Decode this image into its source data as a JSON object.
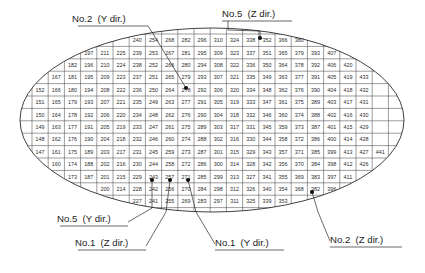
{
  "figure": {
    "type": "elliptical-grid-mesh-diagram",
    "ellipse": {
      "cx": 212,
      "cy": 120,
      "rx": 192,
      "ry": 92
    },
    "grid": {
      "columns": 22,
      "rows": 14,
      "column_step": 14,
      "row_step": -1,
      "cell_width": 16.2,
      "cell_height": 12.4,
      "origin_x": 32,
      "origin_y": 34,
      "first_full_column_base": 147,
      "note": "Each grid column is numbered bottom-to-top ascending by 1; consecutive columns offset by 14"
    },
    "number_range": {
      "min": 139,
      "max": 441
    },
    "edge_numbers": {
      "top_row": [
        215,
        229,
        243,
        257,
        271,
        285,
        299,
        313,
        327,
        341,
        355,
        369,
        383
      ],
      "bottom_row": [
        202,
        216,
        230,
        244,
        258,
        272,
        286,
        300,
        314,
        328,
        342,
        356,
        370
      ],
      "left_edge": [
        147,
        146,
        145,
        144
      ],
      "right_edge": [
        441,
        440,
        439,
        438
      ],
      "upper_left_slope": [
        139,
        165,
        155,
        154,
        153,
        152,
        151,
        150,
        149,
        148
      ],
      "upper_right_slope": [
        395,
        407,
        419,
        429,
        437
      ],
      "lower_right_slope": [
        436,
        430,
        420,
        409,
        408,
        396,
        384,
        371
      ],
      "lower_left_slope": [
        156,
        166,
        178,
        190,
        203
      ]
    }
  },
  "callouts": [
    {
      "id": "no2-y",
      "label": "No.2  (Y dir.)",
      "text_x": 72,
      "text_y": 22,
      "underline_x1": 78,
      "underline_x2": 148,
      "underline_y": 26,
      "leader": "M148,26 L152,32 L186,88",
      "dot_x": 186,
      "dot_y": 88
    },
    {
      "id": "no5-z",
      "label": "No.5  (Z dir.)",
      "text_x": 222,
      "text_y": 17,
      "underline_x1": 222,
      "underline_x2": 292,
      "underline_y": 21,
      "leader": "M228,21 L228,30 L260,31 L260,38",
      "dot_x": 260,
      "dot_y": 38
    },
    {
      "id": "no5-y",
      "label": "No.5  (Y dir.)",
      "text_x": 57,
      "text_y": 222,
      "underline_x1": 60,
      "underline_x2": 128,
      "underline_y": 226,
      "leader": "M128,222 L152,208 L152,180",
      "dot_x": 152,
      "dot_y": 180
    },
    {
      "id": "no1-z",
      "label": "No.1  (Z dir.)",
      "text_x": 75,
      "text_y": 246,
      "underline_x1": 78,
      "underline_x2": 146,
      "underline_y": 250,
      "leader": "M146,246 L166,212 L170,180",
      "dot_x": 170,
      "dot_y": 180
    },
    {
      "id": "no1-y",
      "label": "No.1  (Y dir.)",
      "text_x": 215,
      "text_y": 246,
      "underline_x1": 215,
      "underline_x2": 284,
      "underline_y": 250,
      "leader": "M215,244 L196,212 L188,180",
      "dot_x": 188,
      "dot_y": 180
    },
    {
      "id": "no2-z",
      "label": "No.2  (Z dir.)",
      "text_x": 330,
      "text_y": 243,
      "underline_x1": 330,
      "underline_x2": 402,
      "underline_y": 247,
      "leader": "M330,241 L318,212 L312,192",
      "dot_x": 312,
      "dot_y": 192
    }
  ],
  "marker_dots": [
    {
      "x": 152,
      "y": 180
    },
    {
      "x": 170,
      "y": 180
    },
    {
      "x": 188,
      "y": 180
    },
    {
      "x": 186,
      "y": 88
    },
    {
      "x": 260,
      "y": 38
    },
    {
      "x": 312,
      "y": 192
    }
  ]
}
